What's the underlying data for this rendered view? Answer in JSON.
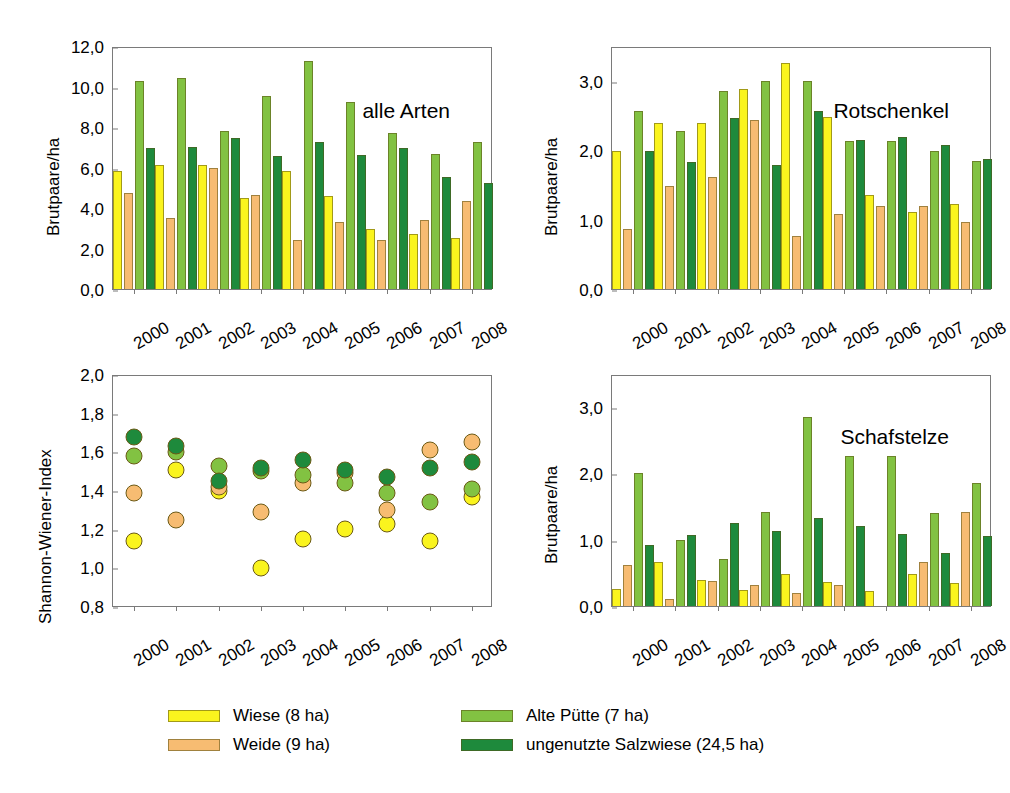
{
  "colors": {
    "wiese": "#FAF41E",
    "weide": "#F7BC72",
    "alte_puette": "#82C242",
    "salzwiese": "#1E8A3C",
    "axis": "#7a7a7a",
    "text": "#000000"
  },
  "legend": {
    "items": [
      {
        "label": "Wiese (8 ha)",
        "color_key": "wiese",
        "series": "Wiese"
      },
      {
        "label": "Weide (9 ha)",
        "color_key": "weide",
        "series": "Weide"
      },
      {
        "label": "Alte Pütte (7 ha)",
        "color_key": "alte_puette",
        "series": "Alte Pütte"
      },
      {
        "label": "ungenutzte Salzwiese (24,5 ha)",
        "color_key": "salzwiese",
        "series": "ungenutzte Salzwiese"
      }
    ]
  },
  "chart_data": [
    {
      "id": "alle-arten",
      "type": "bar",
      "title": "alle Arten",
      "xlabel": "",
      "ylabel": "Brutpaare/ha",
      "ylim": [
        0.0,
        12.0
      ],
      "yticks": [
        0.0,
        2.0,
        4.0,
        6.0,
        8.0,
        10.0,
        12.0
      ],
      "ytick_labels": [
        "0,0",
        "2,0",
        "4,0",
        "6,0",
        "8,0",
        "10,0",
        "12,0"
      ],
      "grid": false,
      "legend_position": "bottom",
      "categories": [
        "2000",
        "2001",
        "2002",
        "2003",
        "2004",
        "2005",
        "2006",
        "2007",
        "2008"
      ],
      "series": [
        {
          "name": "Wiese (8 ha)",
          "color_key": "wiese",
          "values": [
            5.85,
            6.12,
            6.12,
            4.48,
            5.85,
            4.58,
            2.96,
            2.7,
            2.5
          ]
        },
        {
          "name": "Weide (9 ha)",
          "color_key": "weide",
          "values": [
            4.74,
            3.5,
            6.0,
            4.65,
            2.42,
            3.3,
            2.4,
            3.4,
            4.33
          ]
        },
        {
          "name": "Alte Pütte (7 ha)",
          "color_key": "alte_puette",
          "values": [
            10.28,
            10.4,
            7.82,
            9.55,
            11.28,
            9.25,
            7.68,
            6.66,
            7.25
          ]
        },
        {
          "name": "ungenutzte Salzwiese (24,5 ha)",
          "color_key": "salzwiese",
          "values": [
            6.96,
            7.02,
            7.45,
            6.58,
            7.25,
            6.6,
            6.94,
            5.55,
            5.25
          ]
        }
      ]
    },
    {
      "id": "rotschenkel",
      "type": "bar",
      "title": "Rotschenkel",
      "xlabel": "",
      "ylabel": "Brutpaare/ha",
      "ylim": [
        0.0,
        3.5
      ],
      "yticks": [
        0.0,
        1.0,
        2.0,
        3.0
      ],
      "ytick_labels": [
        "0,0",
        "1,0",
        "2,0",
        "3,0"
      ],
      "grid": false,
      "legend_position": "bottom",
      "categories": [
        "2000",
        "2001",
        "2002",
        "2003",
        "2004",
        "2005",
        "2006",
        "2007",
        "2008"
      ],
      "series": [
        {
          "name": "Wiese (8 ha)",
          "color_key": "wiese",
          "values": [
            1.99,
            2.39,
            2.39,
            2.88,
            3.25,
            2.48,
            1.35,
            1.11,
            1.22
          ]
        },
        {
          "name": "Weide (9 ha)",
          "color_key": "weide",
          "values": [
            0.86,
            1.48,
            1.61,
            2.43,
            0.77,
            1.08,
            1.2,
            1.2,
            0.97
          ]
        },
        {
          "name": "Alte Pütte (7 ha)",
          "color_key": "alte_puette",
          "values": [
            2.57,
            2.28,
            2.85,
            3.0,
            2.99,
            2.13,
            2.13,
            1.99,
            1.85
          ]
        },
        {
          "name": "ungenutzte Salzwiese (24,5 ha)",
          "color_key": "salzwiese",
          "values": [
            1.99,
            1.83,
            2.46,
            1.78,
            2.57,
            2.15,
            2.19,
            2.07,
            1.87
          ]
        }
      ]
    },
    {
      "id": "shannon-wiener-index",
      "type": "scatter",
      "title": "",
      "xlabel": "",
      "ylabel": "Shannon-Wiener-Index",
      "ylim": [
        0.8,
        2.0
      ],
      "yticks": [
        0.8,
        1.0,
        1.2,
        1.4,
        1.6,
        1.8,
        2.0
      ],
      "ytick_labels": [
        "0,8",
        "1,0",
        "1,2",
        "1,4",
        "1,6",
        "1,8",
        "2,0"
      ],
      "grid": false,
      "legend_position": "bottom",
      "categories": [
        "2000",
        "2001",
        "2002",
        "2003",
        "2004",
        "2005",
        "2006",
        "2007",
        "2008"
      ],
      "series": [
        {
          "name": "Wiese (8 ha)",
          "color_key": "wiese",
          "values": [
            1.18,
            1.55,
            1.44,
            1.04,
            1.19,
            1.24,
            1.27,
            1.18,
            1.41
          ]
        },
        {
          "name": "Weide (9 ha)",
          "color_key": "weide",
          "values": [
            1.43,
            1.29,
            1.46,
            1.33,
            1.48,
            1.53,
            1.34,
            1.65,
            1.69
          ]
        },
        {
          "name": "Alte Pütte (7 ha)",
          "color_key": "alte_puette",
          "values": [
            1.62,
            1.64,
            1.57,
            1.54,
            1.52,
            1.48,
            1.43,
            1.38,
            1.45
          ]
        },
        {
          "name": "ungenutzte Salzwiese (24,5 ha)",
          "color_key": "salzwiese",
          "values": [
            1.72,
            1.67,
            1.49,
            1.56,
            1.6,
            1.55,
            1.51,
            1.56,
            1.59
          ]
        }
      ]
    },
    {
      "id": "schafstelze",
      "type": "bar",
      "title": "Schafstelze",
      "xlabel": "",
      "ylabel": "Brutpaare/ha",
      "ylim": [
        0.0,
        3.5
      ],
      "yticks": [
        0.0,
        1.0,
        2.0,
        3.0
      ],
      "ytick_labels": [
        "0,0",
        "1,0",
        "2,0",
        "3,0"
      ],
      "grid": false,
      "legend_position": "bottom",
      "categories": [
        "2000",
        "2001",
        "2002",
        "2003",
        "2004",
        "2005",
        "2006",
        "2007",
        "2008"
      ],
      "series": [
        {
          "name": "Wiese (8 ha)",
          "color_key": "wiese",
          "values": [
            0.25,
            0.67,
            0.39,
            0.24,
            0.49,
            0.36,
            0.22,
            0.49,
            0.35
          ]
        },
        {
          "name": "Weide (9 ha)",
          "color_key": "weide",
          "values": [
            0.62,
            0.11,
            0.37,
            0.32,
            0.2,
            0.32,
            0.0,
            0.66,
            1.42
          ]
        },
        {
          "name": "Alte Pütte (7 ha)",
          "color_key": "alte_puette",
          "values": [
            2.0,
            1.0,
            0.71,
            1.42,
            2.85,
            2.27,
            2.27,
            1.41,
            1.85
          ]
        },
        {
          "name": "ungenutzte Salzwiese (24,5 ha)",
          "color_key": "salzwiese",
          "values": [
            0.92,
            1.07,
            1.25,
            1.13,
            1.33,
            1.2,
            1.09,
            0.8,
            1.05
          ]
        }
      ]
    }
  ]
}
